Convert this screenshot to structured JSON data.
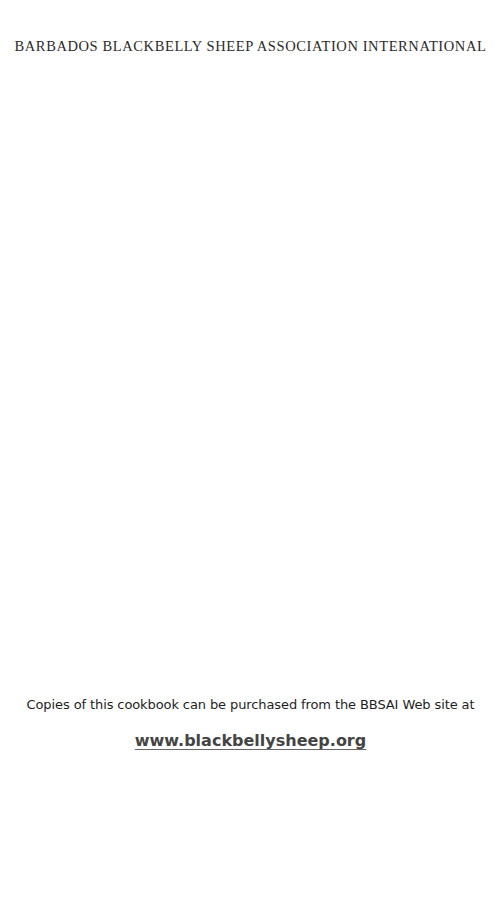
{
  "header": {
    "title": "BARBADOS BLACKBELLY SHEEP ASSOCIATION INTERNATIONAL"
  },
  "body": {
    "purchase_note": "Copies of this cookbook can be purchased from the BBSAI Web site at",
    "website_link": "www.blackbellysheep.org"
  },
  "colors": {
    "background": "#ffffff",
    "text": "#2a2a2a",
    "link": "#444444"
  }
}
